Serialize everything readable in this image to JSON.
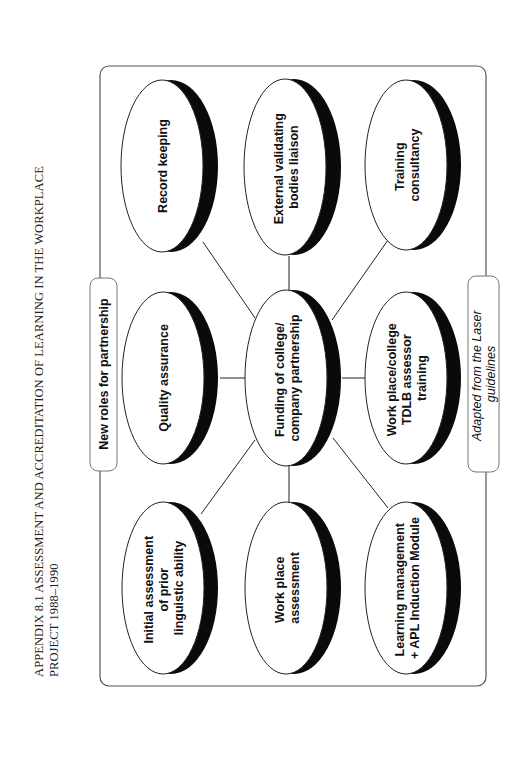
{
  "page": {
    "orientation": "rotated-90-ccw",
    "title_lines": [
      "APPENDIX 8.1 ASSESSMENT AND ACCREDITATION OF LEARNING IN THE WORKPLACE",
      "PROJECT 1988–1990"
    ]
  },
  "diagram": {
    "frame_label": "New roles for partnership",
    "caption_lines": [
      "Adapted from the Laser",
      "guidelines"
    ],
    "center": {
      "id": "funding",
      "lines": [
        "Funding of college/",
        "company partnership"
      ]
    },
    "nodes": [
      {
        "id": "record-keeping",
        "lines": [
          "Record keeping"
        ]
      },
      {
        "id": "external-validating",
        "lines": [
          "External validating",
          "bodies liaison"
        ]
      },
      {
        "id": "training-consultancy",
        "lines": [
          "Training",
          "consultancy"
        ]
      },
      {
        "id": "quality-assurance",
        "lines": [
          "Quality assurance"
        ]
      },
      {
        "id": "tdlb-training",
        "lines": [
          "Work place/college",
          "TDLB assessor",
          "training"
        ]
      },
      {
        "id": "initial-assessment",
        "lines": [
          "Initial assessment",
          "of prior",
          "linguistic ability"
        ]
      },
      {
        "id": "work-place-assessment",
        "lines": [
          "Work place",
          "assessment"
        ]
      },
      {
        "id": "learning-management",
        "lines": [
          "Learning management",
          "+ APL Induction Module"
        ]
      }
    ],
    "colors": {
      "stroke": "#222222",
      "shadow": "#0a0a0a",
      "fill": "#ffffff",
      "frame": "#555555"
    }
  }
}
